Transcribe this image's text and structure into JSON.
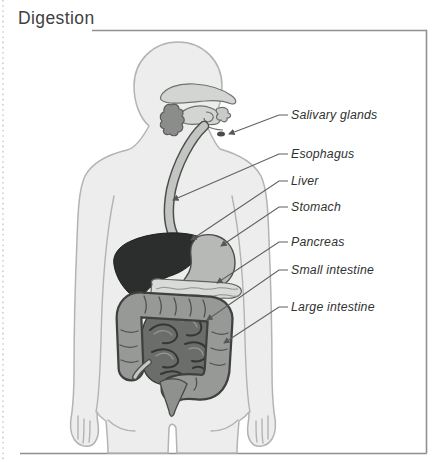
{
  "page": {
    "title": "Digestion"
  },
  "figure": {
    "labels": [
      {
        "id": "salivary-glands",
        "text": "Salivary glands"
      },
      {
        "id": "esophagus",
        "text": "Esophagus"
      },
      {
        "id": "liver",
        "text": "Liver"
      },
      {
        "id": "stomach",
        "text": "Stomach"
      },
      {
        "id": "pancreas",
        "text": "Pancreas"
      },
      {
        "id": "small-intestine",
        "text": "Small intestine"
      },
      {
        "id": "large-intestine",
        "text": "Large intestine"
      }
    ]
  },
  "colors": {
    "body_fill": "#ecedec",
    "body_outline": "#b2b4b2",
    "mouth_parts": "#d2d5d2",
    "salivary_gland": "#8b8d8b",
    "esophagus_fill": "#c3c5c3",
    "esophagus_outline": "#4d4f4d",
    "liver": "#2c2e2d",
    "stomach": "#b7b9b7",
    "pancreas": "#d9dbd9",
    "small_intestine": "#6b6d6b",
    "large_intestine": "#979997",
    "rectum": "#8f918f",
    "organ_outline": "#3f4140",
    "leader_line": "#5f615f",
    "label_text": "#2f3231",
    "frame_line": "#8f9190",
    "title_text": "#3e4140",
    "perforation": "#dcc9c6"
  }
}
